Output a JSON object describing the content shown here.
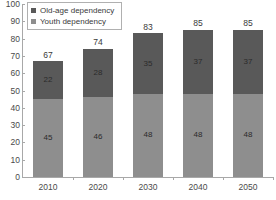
{
  "chart_data": {
    "type": "bar",
    "stacked": true,
    "title": "",
    "xlabel": "",
    "ylabel": "",
    "ylim": [
      0,
      100
    ],
    "ytick_step": 10,
    "yticks": [
      0,
      10,
      20,
      30,
      40,
      50,
      60,
      70,
      80,
      90,
      100
    ],
    "grid": false,
    "legend_position": "top-left",
    "categories": [
      "2010",
      "2020",
      "2030",
      "2040",
      "2050"
    ],
    "series": [
      {
        "name": "Youth dependency",
        "color": "#8e8e8e",
        "values": [
          45,
          46,
          48,
          48,
          48
        ]
      },
      {
        "name": "Old-age dependency",
        "color": "#595959",
        "values": [
          22,
          28,
          35,
          37,
          37
        ]
      }
    ],
    "totals": [
      67,
      74,
      83,
      85,
      85
    ]
  },
  "legend": {
    "items": [
      {
        "label": "Old-age dependency",
        "color": "#595959",
        "marker": "square-marker"
      },
      {
        "label": "Youth dependency",
        "color": "#8e8e8e",
        "marker": "square-marker"
      }
    ]
  },
  "axis": {
    "y_labels": [
      "100",
      "90",
      "80",
      "70",
      "60",
      "50",
      "40",
      "30",
      "20",
      "10",
      "0"
    ],
    "x_labels": [
      "2010",
      "2020",
      "2030",
      "2040",
      "2050"
    ]
  }
}
